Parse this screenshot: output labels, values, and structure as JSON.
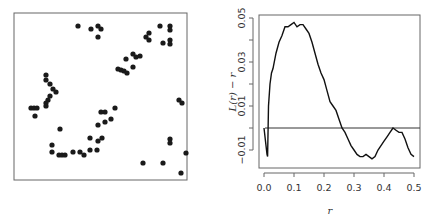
{
  "chart_data": [
    {
      "type": "scatter",
      "title": "",
      "xlabel": "",
      "ylabel": "",
      "axes_visible": false,
      "frame": true,
      "xlim": [
        0,
        1
      ],
      "ylim": [
        0,
        1
      ],
      "points_px": [
        [
          78,
          26
        ],
        [
          91,
          29
        ],
        [
          98,
          26
        ],
        [
          101,
          29
        ],
        [
          98,
          37
        ],
        [
          160,
          26
        ],
        [
          170,
          26
        ],
        [
          170,
          30
        ],
        [
          146,
          37
        ],
        [
          149,
          33
        ],
        [
          149,
          40
        ],
        [
          163,
          43
        ],
        [
          170,
          40
        ],
        [
          170,
          44
        ],
        [
          133,
          54
        ],
        [
          126,
          59
        ],
        [
          136,
          57
        ],
        [
          140,
          56
        ],
        [
          121,
          70
        ],
        [
          124,
          71
        ],
        [
          127,
          73
        ],
        [
          133,
          67
        ],
        [
          118,
          69
        ],
        [
          46,
          75
        ],
        [
          46,
          80
        ],
        [
          50,
          84
        ],
        [
          53,
          89
        ],
        [
          56,
          92
        ],
        [
          50,
          96
        ],
        [
          48,
          100
        ],
        [
          46,
          103
        ],
        [
          46,
          106
        ],
        [
          31,
          108
        ],
        [
          34,
          108
        ],
        [
          37,
          108
        ],
        [
          35,
          116
        ],
        [
          105,
          112
        ],
        [
          115,
          108
        ],
        [
          101,
          112
        ],
        [
          98,
          125
        ],
        [
          105,
          122
        ],
        [
          111,
          119
        ],
        [
          60,
          129
        ],
        [
          90,
          138
        ],
        [
          102,
          138
        ],
        [
          98,
          141
        ],
        [
          90,
          150
        ],
        [
          97,
          150
        ],
        [
          52,
          145
        ],
        [
          52,
          152
        ],
        [
          59,
          155
        ],
        [
          62,
          155
        ],
        [
          65,
          155
        ],
        [
          73,
          152
        ],
        [
          80,
          152
        ],
        [
          84,
          155
        ],
        [
          143,
          163
        ],
        [
          163,
          163
        ],
        [
          181,
          173
        ],
        [
          179,
          100
        ],
        [
          182,
          103
        ],
        [
          170,
          139
        ],
        [
          170,
          143
        ],
        [
          186,
          153
        ]
      ]
    },
    {
      "type": "line",
      "title": "",
      "xlabel": "r",
      "ylabel": "L(r) − r",
      "xlim": [
        0.0,
        0.5
      ],
      "ylim": [
        -0.015,
        0.05
      ],
      "x_ticks": [
        "0.0",
        "0.1",
        "0.2",
        "0.3",
        "0.4",
        "0.5"
      ],
      "y_ticks": [
        "-0.01",
        "0.01",
        "0.03",
        "0.05"
      ],
      "y_minor_ticks": [
        -0.01,
        0.0,
        0.01,
        0.02,
        0.03,
        0.04,
        0.05
      ],
      "reference_line": {
        "y": 0.0,
        "label": "horizontal zero line"
      },
      "series": [
        {
          "name": "L(r) - r",
          "x": [
            0.0,
            0.01,
            0.012,
            0.015,
            0.02,
            0.025,
            0.03,
            0.04,
            0.05,
            0.06,
            0.07,
            0.08,
            0.09,
            0.1,
            0.11,
            0.12,
            0.13,
            0.14,
            0.15,
            0.16,
            0.17,
            0.18,
            0.19,
            0.2,
            0.21,
            0.22,
            0.23,
            0.24,
            0.25,
            0.26,
            0.27,
            0.28,
            0.29,
            0.3,
            0.31,
            0.32,
            0.33,
            0.34,
            0.35,
            0.36,
            0.37,
            0.38,
            0.39,
            0.4,
            0.41,
            0.42,
            0.43,
            0.44,
            0.45,
            0.46,
            0.47,
            0.48,
            0.49,
            0.5
          ],
          "y": [
            0.0,
            -0.012,
            -0.013,
            0.01,
            0.02,
            0.025,
            0.027,
            0.034,
            0.039,
            0.042,
            0.046,
            0.046,
            0.047,
            0.048,
            0.046,
            0.047,
            0.047,
            0.045,
            0.043,
            0.039,
            0.034,
            0.029,
            0.025,
            0.022,
            0.017,
            0.012,
            0.01,
            0.008,
            0.004,
            0.0,
            -0.002,
            -0.005,
            -0.008,
            -0.01,
            -0.012,
            -0.013,
            -0.013,
            -0.012,
            -0.013,
            -0.014,
            -0.013,
            -0.01,
            -0.008,
            -0.006,
            -0.004,
            -0.002,
            0.0,
            -0.001,
            -0.002,
            -0.002,
            -0.005,
            -0.009,
            -0.012,
            -0.013
          ]
        }
      ],
      "grid": false,
      "legend": null
    }
  ],
  "left_plot": {
    "name": "point-pattern"
  },
  "right_plot": {
    "xlabel": "r",
    "ylabel": "L(r) − r",
    "x_tick_labels": [
      "0.0",
      "0.1",
      "0.2",
      "0.3",
      "0.4",
      "0.5"
    ],
    "y_tick_labels": [
      "-0.01",
      "0.01",
      "0.03",
      "0.05"
    ]
  }
}
